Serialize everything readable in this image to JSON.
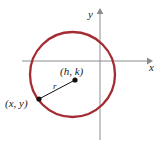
{
  "figure": {
    "name": "circle-standard-form-diagram",
    "type": "geometry-diagram",
    "width": 165,
    "height": 146,
    "background": "#ffffff"
  },
  "axes": {
    "x_axis": {
      "label": "x",
      "label_position": {
        "x": 149,
        "y": 62
      },
      "line": {
        "x1": 22,
        "y1": 61,
        "x2": 150,
        "y2": 61
      },
      "color": "#8c8c8c",
      "arrow": "right"
    },
    "y_axis": {
      "label": "y",
      "label_position": {
        "x": 88,
        "y": 9
      },
      "line": {
        "x1": 100,
        "y1": 140,
        "x2": 100,
        "y2": 12
      },
      "color": "#8c8c8c",
      "arrow": "up"
    },
    "origin": {
      "x": 100,
      "y": 61
    }
  },
  "circle": {
    "center": {
      "x": 72.5,
      "y": 74.5
    },
    "radius": 42.5,
    "stroke": "#a42b32",
    "stroke_width": 2.3,
    "fill": "none"
  },
  "points": [
    {
      "name": "center-point",
      "label": "(h, k)",
      "dot": {
        "x": 75,
        "y": 80,
        "r": 2.6
      },
      "label_position": {
        "x": 60,
        "y": 66
      },
      "color": "#111111"
    },
    {
      "name": "circle-point",
      "label": "(x, y)",
      "dot": {
        "x": 39,
        "y": 99,
        "r": 2.6
      },
      "label_position": {
        "x": 5,
        "y": 98
      },
      "color": "#111111"
    }
  ],
  "radius_segment": {
    "label": "r",
    "label_position": {
      "x": 53,
      "y": 82
    },
    "line": {
      "x1": 39,
      "y1": 99,
      "x2": 75,
      "y2": 80
    },
    "color": "#111111",
    "stroke_width": 1
  }
}
